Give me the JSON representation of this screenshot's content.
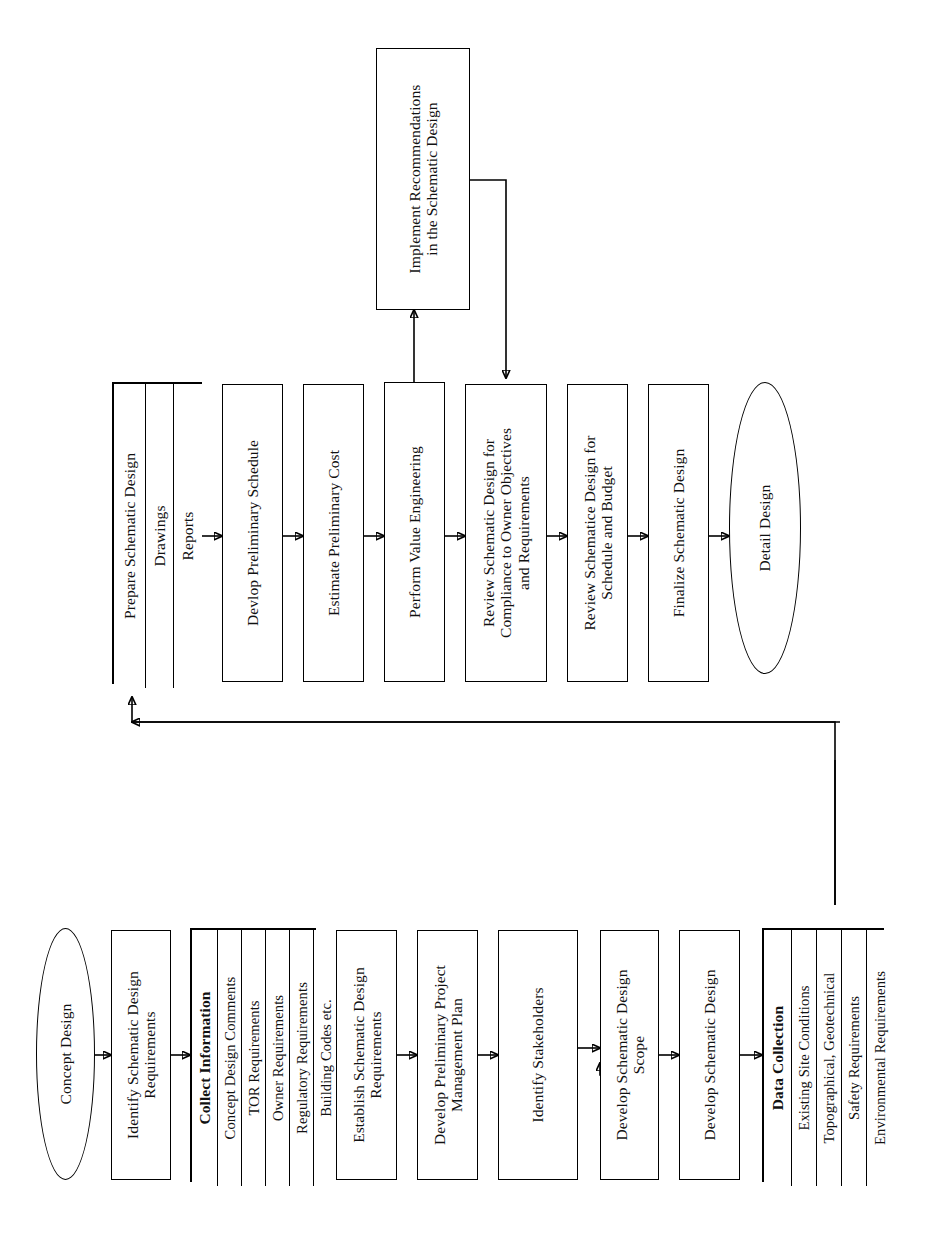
{
  "diagram": {
    "orientation": "rotated-90",
    "nodes": {
      "implement_recommendations": "Implement Recommendations\nin the Schematic Design",
      "prepare_schematic_design": "Prepare Schematic Design",
      "prepare_drawings": "Drawings",
      "prepare_reports": "Reports",
      "develop_preliminary_schedule": "Devlop Preliminary Schedule",
      "estimate_preliminary_cost": "Estimate Preliminary Cost",
      "perform_value_engineering": "Perform Value Engineering",
      "review_compliance": "Review Schematic Design for\nCompliance to Owner Objectives\nand Requirements",
      "review_schedule_budget": "Review Schematice Design for\nSchedule and Budget",
      "finalize_schematic_design": "Finalize Schematic Design",
      "detail_design": "Detail Design",
      "concept_design": "Concept Design",
      "identify_requirements": "Identify Schematic Design\nRequirements",
      "collect_information": "Collect Information",
      "collect_concept_comments": "Concept Design Comments",
      "collect_tor": "TOR Requirements",
      "collect_owner": "Owner Requirements",
      "collect_regulatory": "Regulatory Requirements",
      "collect_codes": "Building Codes etc.",
      "establish_requirements": "Establish Schematic Design\nRequirements",
      "develop_pmp": "Develop Preliminary Project\nManagement Plan",
      "identify_stakeholders": "Identify Stakeholders",
      "develop_scope": "Develop Schematic Design\nScope",
      "develop_schematic_design": "Develop Schematic Design",
      "data_collection": "Data Collection",
      "data_existing_site": "Existing Site Conditions",
      "data_topographical": "Topographical, Geotechnical",
      "data_safety": "Safety Requirements",
      "data_environmental": "Environmental Requirements"
    },
    "colors": {
      "stroke": "#000000",
      "fill": "#ffffff",
      "text": "#111111"
    }
  }
}
